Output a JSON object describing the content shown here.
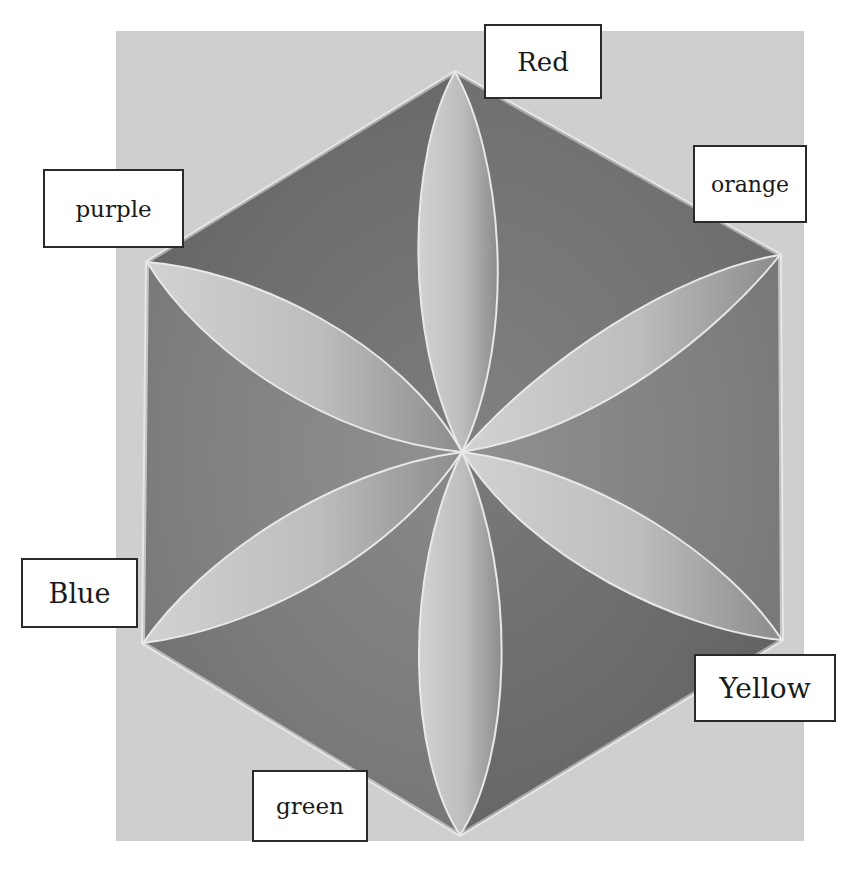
{
  "figure": {
    "type": "hexagon color wheel painting",
    "background_color": "#cfcfcf",
    "hexagon_fill": "#6e6e6e",
    "petal_fill": "#bdbdbd"
  },
  "labels": [
    {
      "id": "red",
      "text": "Red"
    },
    {
      "id": "orange",
      "text": "orange"
    },
    {
      "id": "yellow",
      "text": "Yellow"
    },
    {
      "id": "green",
      "text": "green"
    },
    {
      "id": "blue",
      "text": "Blue"
    },
    {
      "id": "purple",
      "text": "purple"
    }
  ]
}
